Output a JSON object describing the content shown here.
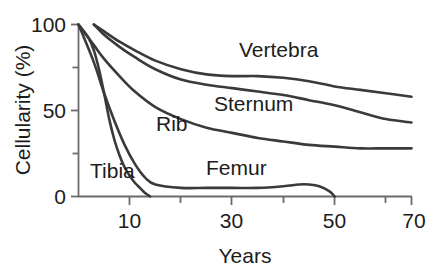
{
  "chart_data": {
    "type": "line",
    "title": "",
    "subtitle": "",
    "xlabel": "Years",
    "ylabel": "Cellularity (%)",
    "xlim": [
      5,
      70
    ],
    "ylim": [
      0,
      100
    ],
    "grid": false,
    "legend_position": "inline-labels",
    "x_ticks_major": [
      10,
      30,
      50,
      70
    ],
    "x_ticks_minor": [
      20,
      40,
      60
    ],
    "x_tick_labels": [
      "10",
      "30",
      "50",
      "70"
    ],
    "y_ticks_major": [
      0,
      50,
      100
    ],
    "y_ticks_minor": [
      25,
      75
    ],
    "y_tick_labels": [
      "0",
      "50",
      "100"
    ],
    "series": [
      {
        "name": "Vertebra",
        "label": "Vertebra",
        "x": [
          8,
          10,
          13,
          16,
          20,
          25,
          30,
          35,
          40,
          45,
          50,
          55,
          60,
          65,
          70
        ],
        "values": [
          100,
          96,
          90,
          85,
          79,
          74,
          71,
          70,
          70,
          69,
          67,
          64,
          62,
          60,
          58
        ]
      },
      {
        "name": "Sternum",
        "label": "Sternum",
        "x": [
          8,
          10,
          13,
          16,
          20,
          25,
          30,
          35,
          40,
          45,
          50,
          55,
          60,
          65,
          70
        ],
        "values": [
          100,
          94,
          87,
          81,
          74,
          68,
          65,
          63,
          61,
          59,
          56,
          53,
          49,
          45,
          43
        ]
      },
      {
        "name": "Rib",
        "label": "Rib",
        "x": [
          5,
          8,
          10,
          13,
          16,
          20,
          25,
          30,
          35,
          40,
          45,
          50,
          55,
          60,
          65,
          70
        ],
        "values": [
          100,
          88,
          80,
          70,
          61,
          52,
          45,
          40,
          37,
          34,
          32,
          30,
          29,
          28,
          28,
          28
        ]
      },
      {
        "name": "Femur",
        "label": "Femur",
        "x": [
          5,
          8,
          10,
          12,
          14,
          16,
          18,
          20,
          25,
          30,
          35,
          40,
          45,
          48,
          50,
          52,
          54,
          55
        ],
        "values": [
          100,
          78,
          60,
          44,
          30,
          19,
          11,
          7,
          5,
          5,
          5,
          5,
          6,
          7,
          7,
          6,
          3,
          0
        ]
      },
      {
        "name": "Tibia",
        "label": "Tibia",
        "x": [
          5,
          7,
          8,
          9,
          10,
          11,
          12,
          13,
          14,
          15,
          16,
          17,
          18,
          19
        ],
        "values": [
          100,
          92,
          85,
          74,
          60,
          45,
          33,
          24,
          17,
          12,
          8,
          5,
          2,
          0
        ]
      }
    ],
    "annotations": [
      {
        "text": "Vertebra",
        "x_px": 239,
        "y_px": 57
      },
      {
        "text": "Sternum",
        "x_px": 214,
        "y_px": 111
      },
      {
        "text": "Rib",
        "x_px": 156,
        "y_px": 131
      },
      {
        "text": "Femur",
        "x_px": 206,
        "y_px": 175
      },
      {
        "text": "Tibia",
        "x_px": 90,
        "y_px": 178
      }
    ],
    "colors": {
      "line": "#3a3a3a",
      "axis": "#6b6b6b",
      "text": "#1c1c1c",
      "background": "#ffffff"
    }
  }
}
